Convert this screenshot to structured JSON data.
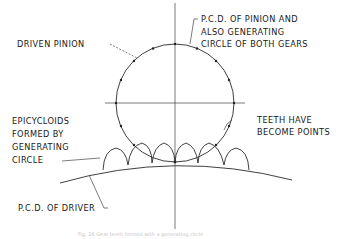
{
  "figure": {
    "labels": {
      "driven_pinion": "DRIVEN PINION",
      "pcd_pinion_line1": "P.C.D. OF PINION AND",
      "pcd_pinion_line2": "ALSO GENERATING",
      "pcd_pinion_line3": "CIRCLE OF BOTH GEARS",
      "epicycloids_line1": "EPICYCLOIDS",
      "epicycloids_line2": "FORMED BY",
      "epicycloids_line3": "GENERATING",
      "epicycloids_line4": "CIRCLE",
      "teeth_line1": "TEETH HAVE",
      "teeth_line2": "BECOME POINTS",
      "pcd_driver": "P.C.D. OF DRIVER"
    },
    "caption": "Fig. 26 Gear teeth formed with a generating circle"
  },
  "colors": {
    "line": "#2a2a2a",
    "text": "#1a1a1a",
    "background": "#ffffff"
  }
}
